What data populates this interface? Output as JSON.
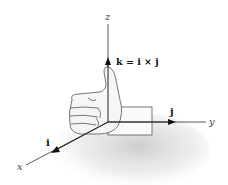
{
  "figure": {
    "axes": {
      "x_label": "x",
      "y_label": "y",
      "z_label": "z"
    },
    "vectors": {
      "i_label": "i",
      "j_label": "j",
      "k_equation": "k = i × j"
    },
    "colors": {
      "line": "#333333",
      "hand_fill": "#f4f4f4",
      "hand_outline": "#555555",
      "shadow": "#bdbdbd"
    }
  }
}
